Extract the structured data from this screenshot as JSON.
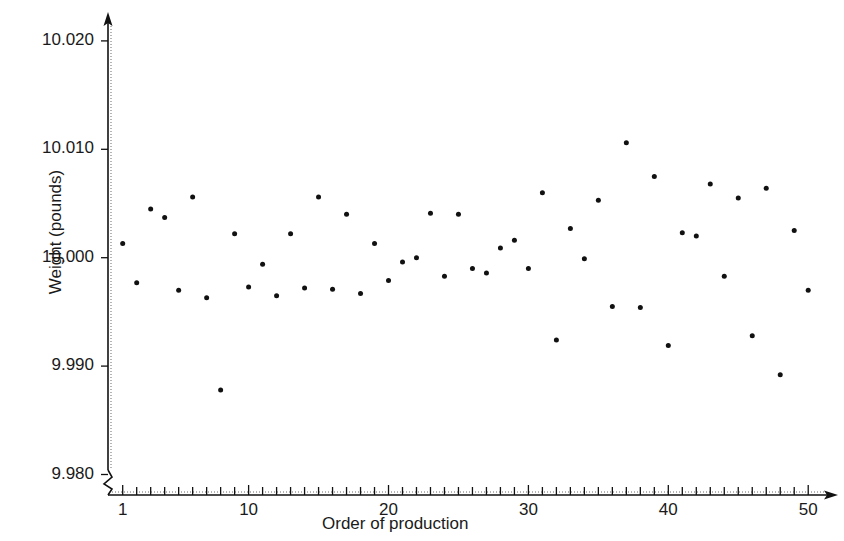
{
  "chart_data": {
    "type": "scatter",
    "title": "",
    "xlabel": "Order of production",
    "ylabel": "Weight (pounds)",
    "xlim": [
      1,
      50
    ],
    "ylim": [
      9.98,
      10.02
    ],
    "grid": false,
    "legend": null,
    "y_ticks": [
      "9.980",
      "9.990",
      "10.000",
      "10.010",
      "10.020"
    ],
    "y_tick_values": [
      9.98,
      9.99,
      10.0,
      10.01,
      10.02
    ],
    "x_ticks": [
      "1",
      "10",
      "20",
      "30",
      "40",
      "50"
    ],
    "x_tick_values": [
      1,
      10,
      20,
      30,
      40,
      50
    ],
    "x_minor_tick_step": 1,
    "y_axis_break": true,
    "x_axis_break": true,
    "marker": "filled-circle",
    "marker_color": "#111111",
    "marker_size_px": 5,
    "x": [
      1,
      2,
      3,
      4,
      5,
      6,
      7,
      8,
      9,
      10,
      11,
      12,
      13,
      14,
      15,
      16,
      17,
      18,
      19,
      20,
      21,
      22,
      23,
      24,
      25,
      26,
      27,
      28,
      29,
      30,
      31,
      32,
      33,
      34,
      35,
      36,
      37,
      38,
      39,
      40,
      41,
      42,
      43,
      44,
      45,
      46,
      47,
      48,
      49,
      50
    ],
    "values": [
      10.0013,
      9.9977,
      10.0045,
      10.0037,
      9.997,
      10.0056,
      9.9963,
      9.9878,
      10.0022,
      9.9973,
      9.9994,
      9.9965,
      10.0022,
      9.9972,
      10.0056,
      9.9971,
      10.004,
      9.9967,
      10.0013,
      9.9979,
      9.9996,
      10.0,
      10.0041,
      9.9983,
      10.004,
      9.999,
      9.9986,
      10.0009,
      10.0016,
      9.999,
      10.006,
      9.9924,
      10.0027,
      9.9999,
      10.0053,
      9.9955,
      10.0106,
      9.9954,
      10.0075,
      9.9919,
      10.0023,
      10.002,
      10.0068,
      9.9983,
      10.0055,
      9.9928,
      10.0064,
      9.9892,
      10.0025,
      9.997
    ]
  },
  "axis": {
    "ylabel_text": "Weight (pounds)",
    "xlabel_text": "Order of production"
  }
}
